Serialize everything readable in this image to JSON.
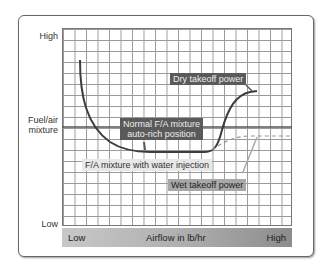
{
  "y_axis": {
    "high_label": "High",
    "title_line1": "Fuel/air",
    "title_line2": "mixture",
    "low_label": "Low"
  },
  "x_axis": {
    "low_label": "Low",
    "title": "Airflow in lb/hr",
    "high_label": "High"
  },
  "callouts": {
    "dry_takeoff": "Dry takeoff power",
    "normal_line1": "Normal F/A mixture",
    "normal_line2": "auto-rich position",
    "water_injection": "F/A mixture with water injection",
    "wet_takeoff": "Wet takeoff power"
  },
  "colors": {
    "curve": "#3c3c3c",
    "dashed_curve": "#999999",
    "reference_line": "#555555"
  }
}
